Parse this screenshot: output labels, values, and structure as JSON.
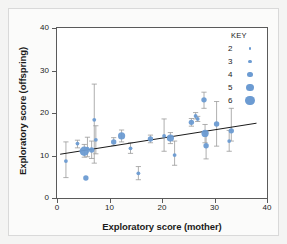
{
  "chart_data": {
    "type": "scatter",
    "title": "",
    "xlabel": "Exploratory score (mother)",
    "ylabel": "Exploratory score (offspring)",
    "xlim": [
      0,
      40
    ],
    "ylim": [
      0,
      40
    ],
    "xticks": [
      0,
      10,
      20,
      30,
      40
    ],
    "yticks": [
      0,
      10,
      20,
      30,
      40
    ],
    "grid": false,
    "legend": {
      "title": "KEY",
      "position": "top-right",
      "description": "marker size encodes number of offspring",
      "entries": [
        {
          "label": "2",
          "size_px": 2.2
        },
        {
          "label": "3",
          "size_px": 3.6
        },
        {
          "label": "4",
          "size_px": 5.4
        },
        {
          "label": "5",
          "size_px": 7.2
        },
        {
          "label": "6",
          "size_px": 9.4
        }
      ]
    },
    "marker_color": "#6c9bd2",
    "errorbar_color": "#9a9a9a",
    "trendline": {
      "color": "#1b1b1b",
      "x0": 0.6,
      "y0": 10.3,
      "x1": 38.0,
      "y1": 17.6
    },
    "points": [
      {
        "x": 1.7,
        "y": 8.7,
        "size": 3,
        "ylow": 4.8,
        "yhigh": 13.2
      },
      {
        "x": 3.9,
        "y": 12.8,
        "size": 3,
        "ylow": 11.8,
        "yhigh": 13.6
      },
      {
        "x": 5.2,
        "y": 11.0,
        "size": 6,
        "ylow": 9.6,
        "yhigh": 12.6
      },
      {
        "x": 5.5,
        "y": 4.7,
        "size": 4,
        "ylow": null,
        "yhigh": null
      },
      {
        "x": 5.8,
        "y": 11.6,
        "size": 3,
        "ylow": 9.7,
        "yhigh": 14.3
      },
      {
        "x": 6.6,
        "y": 11.3,
        "size": 4,
        "ylow": 9.3,
        "yhigh": 13.4
      },
      {
        "x": 7.1,
        "y": 18.4,
        "size": 3,
        "ylow": 8.2,
        "yhigh": 26.8
      },
      {
        "x": 7.4,
        "y": 13.7,
        "size": 3,
        "ylow": 10.4,
        "yhigh": 17.0
      },
      {
        "x": 10.8,
        "y": 13.2,
        "size": 4,
        "ylow": 12.3,
        "yhigh": 14.2
      },
      {
        "x": 12.3,
        "y": 14.6,
        "size": 5,
        "ylow": 13.2,
        "yhigh": 16.0
      },
      {
        "x": 14.0,
        "y": 11.7,
        "size": 3,
        "ylow": 10.5,
        "yhigh": 13.0
      },
      {
        "x": 15.5,
        "y": 5.8,
        "size": 3,
        "ylow": 4.3,
        "yhigh": 7.4
      },
      {
        "x": 17.8,
        "y": 13.9,
        "size": 4,
        "ylow": 13.0,
        "yhigh": 14.8
      },
      {
        "x": 20.4,
        "y": 14.6,
        "size": 3,
        "ylow": 11.0,
        "yhigh": 18.6
      },
      {
        "x": 21.6,
        "y": 14.1,
        "size": 5,
        "ylow": 12.8,
        "yhigh": 15.4
      },
      {
        "x": 22.4,
        "y": 10.1,
        "size": 3,
        "ylow": 7.7,
        "yhigh": 13.4
      },
      {
        "x": 25.6,
        "y": 17.8,
        "size": 4,
        "ylow": 16.9,
        "yhigh": 18.7
      },
      {
        "x": 26.4,
        "y": 19.3,
        "size": 3,
        "ylow": 18.6,
        "yhigh": 20.1
      },
      {
        "x": 26.8,
        "y": 18.6,
        "size": 3,
        "ylow": 18.0,
        "yhigh": 19.2
      },
      {
        "x": 28.0,
        "y": 23.1,
        "size": 4,
        "ylow": 21.1,
        "yhigh": 24.9
      },
      {
        "x": 28.2,
        "y": 15.2,
        "size": 5,
        "ylow": 13.0,
        "yhigh": 17.3
      },
      {
        "x": 28.4,
        "y": 12.3,
        "size": 4,
        "ylow": 9.2,
        "yhigh": 15.3
      },
      {
        "x": 30.4,
        "y": 17.4,
        "size": 4,
        "ylow": 12.2,
        "yhigh": 22.7
      },
      {
        "x": 32.8,
        "y": 13.4,
        "size": 3,
        "ylow": 11.0,
        "yhigh": 15.9
      },
      {
        "x": 33.2,
        "y": 15.8,
        "size": 4,
        "ylow": 13.4,
        "yhigh": 21.1
      }
    ]
  }
}
